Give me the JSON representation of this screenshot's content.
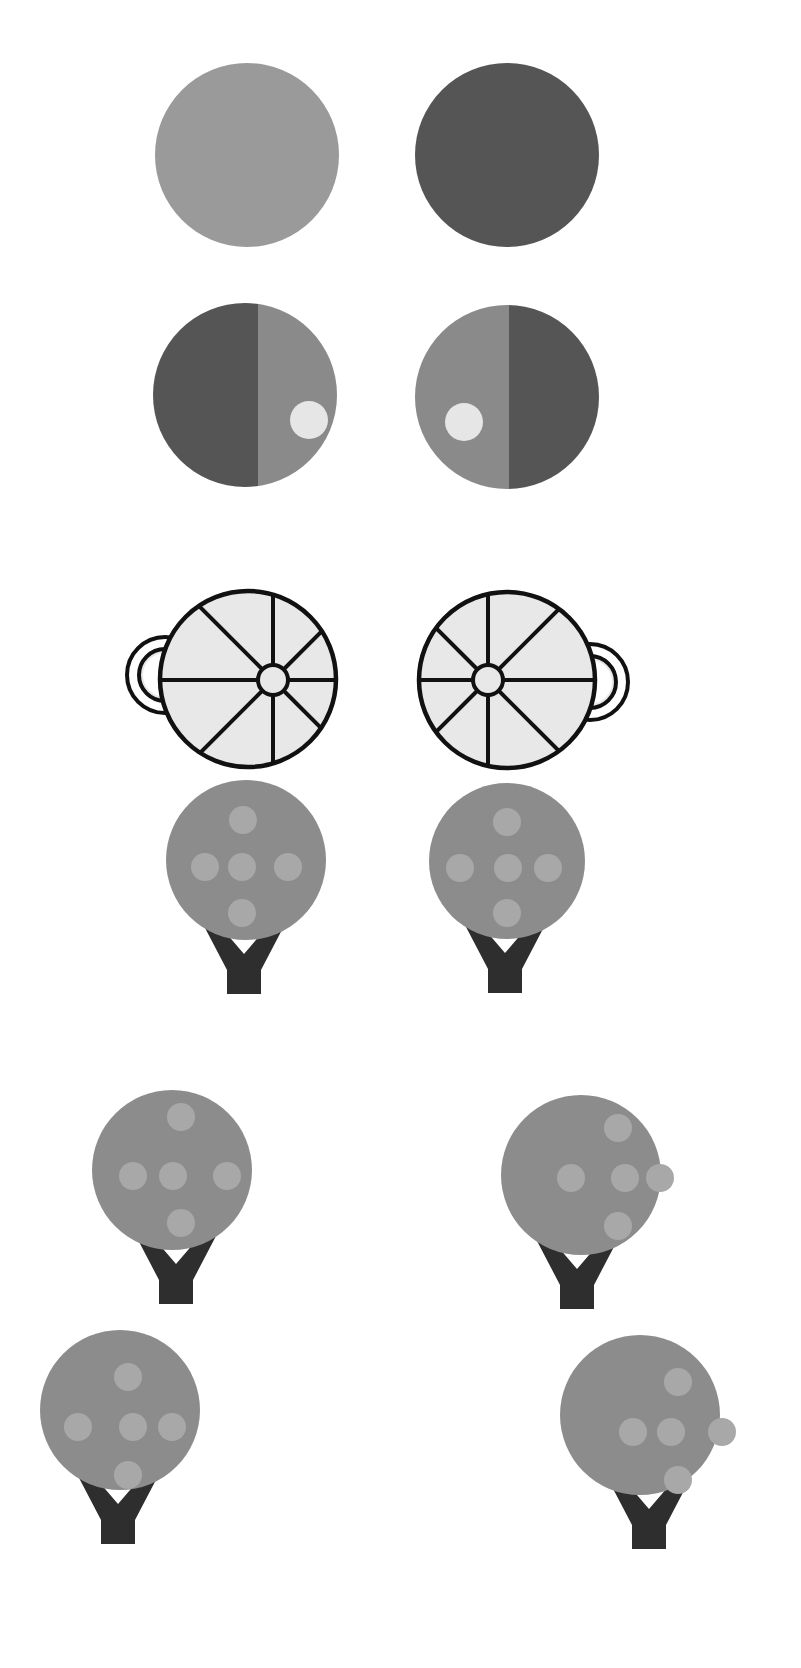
{
  "canvas": {
    "width": 801,
    "height": 1668,
    "background": "#ffffff"
  },
  "colors": {
    "light_gray": "#9a9a9a",
    "dark_gray": "#555555",
    "mid_gray": "#8a8a8a",
    "pale": "#e6e6e6",
    "wheel_fill": "#e8e8e8",
    "ink": "#111111",
    "canopy": "#8c8c8c",
    "fruit": "#a8a8a8",
    "trunk": "#2e2e2e"
  },
  "rows": [
    {
      "name": "row-solid-circles",
      "items": [
        {
          "type": "solid-circle",
          "side": "left",
          "cx": 247,
          "cy": 155,
          "r": 92,
          "fill": "#9a9a9a"
        },
        {
          "type": "solid-circle",
          "side": "right",
          "cx": 507,
          "cy": 155,
          "r": 92,
          "fill": "#555555"
        }
      ]
    },
    {
      "name": "row-split-circles",
      "items": [
        {
          "type": "split-circle",
          "side": "left",
          "cx": 245,
          "cy": 395,
          "r": 92,
          "split_x": 258,
          "left_fill": "#555555",
          "right_fill": "#8a8a8a",
          "dot": {
            "cx": 309,
            "cy": 420,
            "r": 19,
            "fill": "#e6e6e6"
          }
        },
        {
          "type": "split-circle",
          "side": "right",
          "cx": 507,
          "cy": 397,
          "r": 92,
          "split_x": 509,
          "left_fill": "#8a8a8a",
          "right_fill": "#555555",
          "dot": {
            "cx": 464,
            "cy": 422,
            "r": 19,
            "fill": "#e6e6e6"
          }
        }
      ]
    },
    {
      "name": "row-wheels",
      "items": [
        {
          "type": "wheel",
          "side": "left",
          "cx": 248,
          "cy": 679,
          "r": 88,
          "hub": {
            "cx": 273,
            "cy": 680,
            "r": 15
          },
          "handle": {
            "side": "left",
            "cx": 165,
            "cy": 675,
            "r_outer": 40,
            "r_inner": 26
          }
        },
        {
          "type": "wheel",
          "side": "right",
          "cx": 507,
          "cy": 680,
          "r": 88,
          "hub": {
            "cx": 488,
            "cy": 680,
            "r": 15
          },
          "handle": {
            "side": "right",
            "cx": 590,
            "cy": 682,
            "r_outer": 40,
            "r_inner": 26
          }
        }
      ]
    },
    {
      "name": "row-trees-1",
      "items": [
        {
          "type": "tree",
          "side": "left",
          "canopy": {
            "cx": 246,
            "cy": 860,
            "r": 80
          },
          "fruit_r": 14,
          "fruits": [
            [
              243,
              820
            ],
            [
              205,
              867
            ],
            [
              242,
              867
            ],
            [
              288,
              867
            ],
            [
              242,
              913
            ]
          ],
          "trunk": {
            "cx": 244,
            "top": 933,
            "bottom": 993
          }
        },
        {
          "type": "tree",
          "side": "right",
          "canopy": {
            "cx": 507,
            "cy": 861,
            "r": 78
          },
          "fruit_r": 14,
          "fruits": [
            [
              507,
              822
            ],
            [
              460,
              868
            ],
            [
              508,
              868
            ],
            [
              548,
              868
            ],
            [
              507,
              913
            ]
          ],
          "trunk": {
            "cx": 505,
            "top": 933,
            "bottom": 996
          }
        }
      ]
    },
    {
      "name": "row-trees-2",
      "items": [
        {
          "type": "tree",
          "side": "left",
          "canopy": {
            "cx": 172,
            "cy": 1170,
            "r": 80
          },
          "fruit_r": 14,
          "fruits": [
            [
              181,
              1117
            ],
            [
              133,
              1176
            ],
            [
              173,
              1176
            ],
            [
              227,
              1176
            ],
            [
              181,
              1223
            ]
          ],
          "trunk": {
            "cx": 176,
            "top": 1242,
            "bottom": 1232
          }
        },
        {
          "type": "tree",
          "side": "right",
          "canopy": {
            "cx": 581,
            "cy": 1175,
            "r": 80
          },
          "fruit_r": 14,
          "fruits": [
            [
              618,
              1128
            ],
            [
              571,
              1178
            ],
            [
              625,
              1178
            ],
            [
              660,
              1178
            ],
            [
              618,
              1226
            ]
          ],
          "trunk": {
            "cx": 577,
            "top": 1242,
            "bottom": 1236
          }
        }
      ]
    },
    {
      "name": "row-trees-3",
      "items": [
        {
          "type": "tree",
          "side": "left",
          "canopy": {
            "cx": 120,
            "cy": 1410,
            "r": 80
          },
          "fruit_r": 14,
          "fruits": [
            [
              128,
              1377
            ],
            [
              78,
              1427
            ],
            [
              133,
              1427
            ],
            [
              172,
              1427
            ],
            [
              128,
              1475
            ]
          ],
          "trunk": {
            "cx": 118,
            "top": 1488,
            "bottom": 1560
          }
        },
        {
          "type": "tree",
          "side": "right",
          "canopy": {
            "cx": 640,
            "cy": 1415,
            "r": 80
          },
          "fruit_r": 14,
          "fruits": [
            [
              678,
              1382
            ],
            [
              633,
              1432
            ],
            [
              671,
              1432
            ],
            [
              722,
              1432
            ],
            [
              678,
              1480
            ]
          ],
          "trunk": {
            "cx": 649,
            "top": 1490,
            "bottom": 1563
          }
        }
      ]
    }
  ]
}
